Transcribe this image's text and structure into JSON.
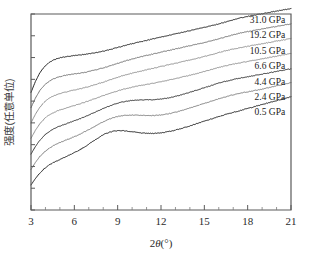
{
  "chart_data": {
    "type": "line",
    "title": "",
    "subtitle": "",
    "xlabel": "2θ(°)",
    "ylabel": "强度(任意单位)",
    "xlim": [
      3,
      21
    ],
    "ylim": [
      0,
      1
    ],
    "grid": false,
    "legend_position": "inline-right",
    "xticks": [
      "3",
      "6",
      "9",
      "12",
      "15",
      "18",
      "21"
    ],
    "xtick_values": [
      3,
      6,
      9,
      12,
      15,
      18,
      21
    ],
    "xminor_step": 1,
    "yticks": [],
    "ytick_count": 9,
    "annotations": [
      {
        "text": "31.0 GPa",
        "x": 20.6,
        "y": 0.955
      },
      {
        "text": "19.2 GPa",
        "x": 20.6,
        "y": 0.876
      },
      {
        "text": "10.5 GPa",
        "x": 20.6,
        "y": 0.798
      },
      {
        "text": "6.6 GPa",
        "x": 20.6,
        "y": 0.721
      },
      {
        "text": "4.4 GPa",
        "x": 20.6,
        "y": 0.64
      },
      {
        "text": "2.4 GPa",
        "x": 20.6,
        "y": 0.562
      },
      {
        "text": "0.5 GPa",
        "x": 20.6,
        "y": 0.484
      }
    ],
    "x": [
      3.0,
      3.3,
      3.6,
      3.9,
      4.2,
      4.5,
      4.8,
      5.1,
      5.4,
      5.7,
      6.0,
      6.3,
      6.6,
      6.9,
      7.2,
      7.5,
      7.8,
      8.1,
      8.4,
      8.7,
      9.0,
      9.3,
      9.6,
      9.9,
      10.2,
      10.5,
      10.8,
      11.1,
      11.4,
      11.7,
      12.0,
      12.3,
      12.6,
      12.9,
      13.2,
      13.5,
      13.8,
      14.1,
      14.4,
      14.7,
      15.0,
      15.3,
      15.6,
      15.9,
      16.2,
      16.5,
      16.8,
      17.1,
      17.4,
      17.7,
      18.0,
      18.3,
      18.6,
      18.9,
      19.2,
      19.5,
      19.8,
      20.1,
      20.4,
      20.7,
      21.0
    ],
    "series": [
      {
        "name": "31.0 GPa",
        "color": "#1a1a1a",
        "offset": 0.6,
        "values": [
          0.0,
          0.055,
          0.098,
          0.128,
          0.149,
          0.163,
          0.172,
          0.178,
          0.182,
          0.185,
          0.188,
          0.19,
          0.193,
          0.196,
          0.199,
          0.203,
          0.207,
          0.212,
          0.217,
          0.223,
          0.229,
          0.235,
          0.241,
          0.247,
          0.252,
          0.257,
          0.262,
          0.267,
          0.272,
          0.277,
          0.282,
          0.287,
          0.292,
          0.297,
          0.302,
          0.307,
          0.312,
          0.317,
          0.322,
          0.327,
          0.332,
          0.337,
          0.342,
          0.348,
          0.354,
          0.36,
          0.366,
          0.372,
          0.378,
          0.383,
          0.388,
          0.392,
          0.396,
          0.4,
          0.404,
          0.408,
          0.412,
          0.416,
          0.42,
          0.424,
          0.428
        ]
      },
      {
        "name": "19.2 GPa",
        "color": "#6e6e6e",
        "offset": 0.522,
        "values": [
          0.0,
          0.048,
          0.086,
          0.113,
          0.132,
          0.145,
          0.154,
          0.16,
          0.165,
          0.169,
          0.172,
          0.175,
          0.179,
          0.183,
          0.188,
          0.193,
          0.199,
          0.205,
          0.212,
          0.219,
          0.226,
          0.233,
          0.24,
          0.246,
          0.252,
          0.258,
          0.263,
          0.268,
          0.273,
          0.278,
          0.283,
          0.288,
          0.293,
          0.298,
          0.303,
          0.308,
          0.313,
          0.318,
          0.323,
          0.328,
          0.333,
          0.338,
          0.344,
          0.35,
          0.356,
          0.362,
          0.368,
          0.374,
          0.379,
          0.384,
          0.388,
          0.392,
          0.396,
          0.4,
          0.404,
          0.408,
          0.412,
          0.416,
          0.42,
          0.424,
          0.428
        ]
      },
      {
        "name": "10.5 GPa",
        "color": "#8c8c8c",
        "offset": 0.444,
        "values": [
          0.0,
          0.044,
          0.079,
          0.105,
          0.123,
          0.136,
          0.145,
          0.152,
          0.158,
          0.163,
          0.168,
          0.173,
          0.178,
          0.184,
          0.19,
          0.197,
          0.204,
          0.211,
          0.219,
          0.226,
          0.233,
          0.24,
          0.246,
          0.252,
          0.258,
          0.263,
          0.268,
          0.273,
          0.278,
          0.283,
          0.288,
          0.293,
          0.298,
          0.303,
          0.308,
          0.313,
          0.318,
          0.323,
          0.328,
          0.333,
          0.339,
          0.345,
          0.351,
          0.357,
          0.363,
          0.369,
          0.374,
          0.379,
          0.383,
          0.387,
          0.391,
          0.395,
          0.399,
          0.403,
          0.407,
          0.411,
          0.415,
          0.419,
          0.423,
          0.427,
          0.431
        ]
      },
      {
        "name": "6.6 GPa",
        "color": "#8c8c8c",
        "offset": 0.366,
        "values": [
          0.0,
          0.04,
          0.073,
          0.098,
          0.116,
          0.129,
          0.139,
          0.147,
          0.154,
          0.161,
          0.167,
          0.174,
          0.181,
          0.188,
          0.196,
          0.204,
          0.212,
          0.22,
          0.228,
          0.235,
          0.242,
          0.248,
          0.254,
          0.259,
          0.264,
          0.268,
          0.272,
          0.276,
          0.28,
          0.284,
          0.288,
          0.293,
          0.298,
          0.303,
          0.308,
          0.313,
          0.318,
          0.323,
          0.329,
          0.335,
          0.341,
          0.347,
          0.353,
          0.359,
          0.365,
          0.37,
          0.375,
          0.38,
          0.384,
          0.388,
          0.392,
          0.396,
          0.4,
          0.404,
          0.408,
          0.412,
          0.416,
          0.42,
          0.424,
          0.428,
          0.432
        ]
      },
      {
        "name": "4.4 GPa",
        "color": "#2a2a2a",
        "offset": 0.285,
        "values": [
          0.0,
          0.038,
          0.07,
          0.094,
          0.112,
          0.126,
          0.137,
          0.146,
          0.154,
          0.162,
          0.17,
          0.178,
          0.187,
          0.196,
          0.206,
          0.216,
          0.226,
          0.236,
          0.245,
          0.253,
          0.26,
          0.266,
          0.27,
          0.273,
          0.275,
          0.276,
          0.277,
          0.277,
          0.278,
          0.279,
          0.281,
          0.284,
          0.288,
          0.293,
          0.299,
          0.305,
          0.311,
          0.318,
          0.325,
          0.332,
          0.339,
          0.346,
          0.353,
          0.36,
          0.366,
          0.372,
          0.377,
          0.382,
          0.387,
          0.391,
          0.395,
          0.399,
          0.403,
          0.407,
          0.411,
          0.415,
          0.419,
          0.423,
          0.427,
          0.431,
          0.435
        ]
      },
      {
        "name": "2.4 GPa",
        "color": "#7a7a7a",
        "offset": 0.207,
        "values": [
          0.0,
          0.035,
          0.065,
          0.088,
          0.105,
          0.119,
          0.13,
          0.14,
          0.149,
          0.158,
          0.167,
          0.177,
          0.188,
          0.199,
          0.211,
          0.223,
          0.235,
          0.246,
          0.256,
          0.264,
          0.27,
          0.274,
          0.276,
          0.277,
          0.277,
          0.276,
          0.275,
          0.275,
          0.275,
          0.276,
          0.278,
          0.281,
          0.285,
          0.29,
          0.296,
          0.302,
          0.309,
          0.316,
          0.323,
          0.33,
          0.337,
          0.344,
          0.351,
          0.358,
          0.365,
          0.371,
          0.377,
          0.382,
          0.387,
          0.392,
          0.396,
          0.4,
          0.404,
          0.408,
          0.413,
          0.418,
          0.423,
          0.428,
          0.433,
          0.438,
          0.443
        ]
      },
      {
        "name": "0.5 GPa",
        "color": "#1a1a1a",
        "offset": 0.128,
        "values": [
          0.0,
          0.032,
          0.06,
          0.082,
          0.099,
          0.112,
          0.123,
          0.133,
          0.143,
          0.153,
          0.164,
          0.176,
          0.189,
          0.203,
          0.218,
          0.233,
          0.247,
          0.259,
          0.268,
          0.274,
          0.277,
          0.277,
          0.275,
          0.272,
          0.269,
          0.266,
          0.264,
          0.263,
          0.263,
          0.264,
          0.266,
          0.269,
          0.273,
          0.278,
          0.284,
          0.29,
          0.297,
          0.304,
          0.311,
          0.318,
          0.325,
          0.332,
          0.339,
          0.346,
          0.353,
          0.36,
          0.366,
          0.372,
          0.378,
          0.384,
          0.39,
          0.396,
          0.402,
          0.408,
          0.414,
          0.42,
          0.426,
          0.432,
          0.438,
          0.444,
          0.45
        ]
      }
    ]
  },
  "figure": {
    "plot_left": 31,
    "plot_right": 291,
    "plot_top": 14,
    "plot_bottom": 210
  }
}
